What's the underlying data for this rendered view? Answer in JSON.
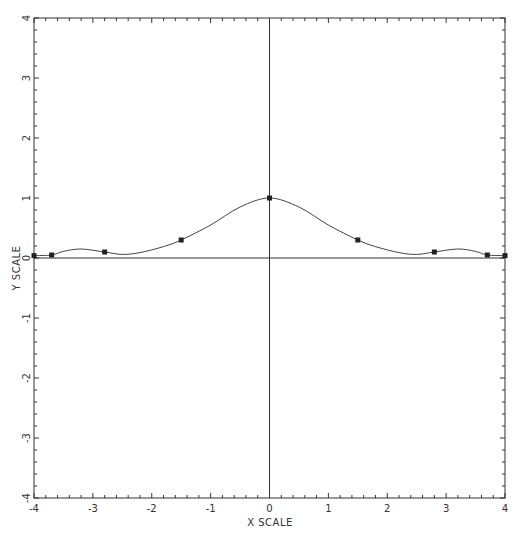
{
  "chart_data": {
    "type": "line",
    "title": "",
    "xlabel": "X SCALE",
    "ylabel": "Y SCALE",
    "xlim": [
      -4,
      4
    ],
    "ylim": [
      -4,
      4
    ],
    "grid": false,
    "legend": null,
    "x_ticks": [
      -4,
      -3,
      -2,
      -1,
      0,
      1,
      2,
      3,
      4
    ],
    "y_ticks": [
      -4,
      -3,
      -2,
      -1,
      0,
      1,
      2,
      3,
      4
    ],
    "x_tick_labels": [
      "-4",
      "-3",
      "-2",
      "-1",
      "0",
      "1",
      "2",
      "3",
      "4"
    ],
    "y_tick_labels": [
      "-4",
      "-3",
      "-2",
      "-1",
      "0",
      "1",
      "2",
      "3",
      "4"
    ],
    "minor_ticks_per_major": 5,
    "zero_axes": true,
    "series": [
      {
        "name": "interpolated curve",
        "style": "smooth line",
        "x": [
          -4.0,
          -3.7,
          -3.5,
          -3.2,
          -2.8,
          -2.5,
          -2.2,
          -1.8,
          -1.5,
          -1.0,
          -0.5,
          0.0,
          0.5,
          1.0,
          1.5,
          1.8,
          2.2,
          2.5,
          2.8,
          3.2,
          3.5,
          3.7,
          4.0
        ],
        "y": [
          0.04,
          0.05,
          0.11,
          0.15,
          0.1,
          0.06,
          0.09,
          0.19,
          0.3,
          0.55,
          0.85,
          1.0,
          0.85,
          0.55,
          0.3,
          0.19,
          0.09,
          0.06,
          0.1,
          0.15,
          0.11,
          0.05,
          0.04
        ]
      },
      {
        "name": "data points",
        "style": "square markers",
        "x": [
          -4.0,
          -3.7,
          -2.8,
          -1.5,
          0.0,
          1.5,
          2.8,
          3.7,
          4.0
        ],
        "y": [
          0.04,
          0.05,
          0.1,
          0.3,
          1.0,
          0.3,
          0.1,
          0.05,
          0.04
        ]
      }
    ]
  },
  "colors": {
    "background": "#ffffff",
    "ink": "#333333"
  }
}
